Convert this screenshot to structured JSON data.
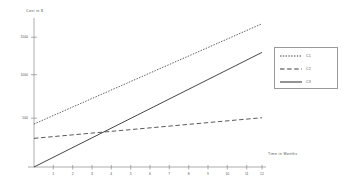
{
  "chart_data": {
    "type": "line",
    "title": "",
    "xlabel": "Time in Months",
    "ylabel": "Cost in $",
    "xlim": [
      0,
      12.6
    ],
    "ylim": [
      0,
      2600
    ],
    "grid": false,
    "legend_position": "right",
    "x": [
      0,
      12
    ],
    "xticks": [
      1,
      2,
      3,
      4,
      5,
      6,
      7,
      8,
      9,
      10,
      11,
      12
    ],
    "xticklabels": [
      "1",
      "2",
      "3",
      "4",
      "5",
      "6",
      "7",
      "8",
      "9",
      "10",
      "11",
      "12"
    ],
    "yticks": [
      500,
      1000,
      1500
    ],
    "yticklabels": [
      "500",
      "1000",
      "1500"
    ],
    "series": [
      {
        "name": "C1",
        "style": "dotted",
        "color": "#3c3c3c",
        "values": [
          750,
          2500
        ]
      },
      {
        "name": "C2",
        "style": "dashed",
        "color": "#3c3c3c",
        "values": [
          500,
          860
        ]
      },
      {
        "name": "C3",
        "style": "solid",
        "color": "#3c3c3c",
        "values": [
          0,
          2000
        ]
      }
    ]
  },
  "axes": {
    "y_axis_title": "Cost in $",
    "x_axis_title": "Time in Months",
    "y_tick_labels": [
      "1500",
      "1000",
      "500"
    ],
    "x_tick_labels": [
      "1",
      "2",
      "3",
      "4",
      "5",
      "6",
      "7",
      "8",
      "9",
      "10",
      "11",
      "12"
    ]
  },
  "legend": {
    "entries": [
      {
        "label": "C1",
        "style": "dotted"
      },
      {
        "label": "C2",
        "style": "dashed"
      },
      {
        "label": "C3",
        "style": "solid"
      }
    ]
  },
  "colors": {
    "line": "#3c3c3c",
    "axis": "#8a8a8a",
    "text": "#555555",
    "legend_border": "#9a9a9a",
    "background": "#ffffff"
  }
}
